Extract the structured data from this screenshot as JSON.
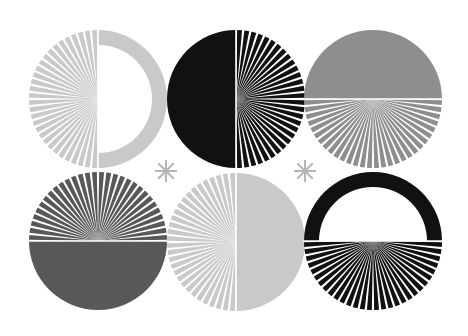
{
  "artwork": {
    "description": "Six circular sunburst motifs arranged in a 2x3 grid with two asterisk glyphs between rows",
    "colors": {
      "background": "#ffffff",
      "light_gray": "#c9c9c9",
      "mid_gray": "#8e8e8e",
      "dark_gray": "#585858",
      "black": "#111111",
      "asterisk": "#b5b5b5"
    },
    "motifs": [
      {
        "name": "light-gray-left-rays-right-ring",
        "color": "light_gray",
        "rays_half": "left",
        "solid_half": "right-ring",
        "ray_count": 30
      },
      {
        "name": "black-left-solid-right-rays",
        "color": "black",
        "rays_half": "right",
        "solid_half": "left",
        "ray_count": 30
      },
      {
        "name": "mid-gray-top-solid-bottom-rays",
        "color": "mid_gray",
        "rays_half": "bottom",
        "solid_half": "top",
        "ray_count": 30
      },
      {
        "name": "dark-gray-top-rays-bottom-solid",
        "color": "dark_gray",
        "rays_half": "top",
        "solid_half": "bottom",
        "ray_count": 30
      },
      {
        "name": "light-gray-left-rays-right-solid",
        "color": "light_gray",
        "rays_half": "left",
        "solid_half": "right",
        "ray_count": 30
      },
      {
        "name": "black-top-ring-bottom-rays",
        "color": "black",
        "rays_half": "bottom",
        "solid_half": "top-ring",
        "ray_count": 30
      }
    ],
    "asterisk_count": 2
  }
}
